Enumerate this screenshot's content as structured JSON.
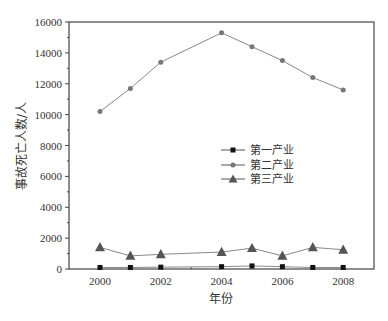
{
  "chart_data": {
    "type": "line",
    "title": "",
    "xlabel": "年份",
    "ylabel": "事故死亡人数/人",
    "x": [
      2000,
      2001,
      2002,
      2004,
      2005,
      2006,
      2007,
      2008
    ],
    "xticks": [
      "2000",
      "2002",
      "2004",
      "2006",
      "2008"
    ],
    "yticks": [
      "0",
      "2000",
      "4000",
      "6000",
      "8000",
      "10000",
      "12000",
      "14000",
      "16000"
    ],
    "xlim": [
      1999,
      2009
    ],
    "ylim": [
      0,
      16000
    ],
    "grid": false,
    "legend_position": "center-right",
    "series": [
      {
        "name": "第一产业",
        "marker": "square",
        "color": "#111111",
        "values": [
          100,
          100,
          120,
          150,
          200,
          150,
          100,
          100
        ]
      },
      {
        "name": "第二产业",
        "marker": "circle",
        "color": "#777777",
        "values": [
          10200,
          11700,
          13400,
          15300,
          14400,
          13500,
          12400,
          11600
        ]
      },
      {
        "name": "第三产业",
        "marker": "triangle",
        "color": "#555555",
        "values": [
          1400,
          850,
          950,
          1100,
          1350,
          850,
          1400,
          1250
        ]
      }
    ]
  }
}
